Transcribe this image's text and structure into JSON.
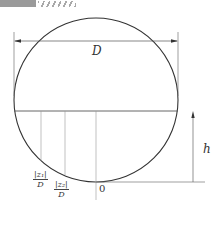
{
  "header": {
    "decoration": "striped-banner"
  },
  "diagram": {
    "title": "",
    "labels": {
      "diameter": "D",
      "height": "h",
      "origin": "0",
      "z1_num": "|z₁|",
      "z1_den": "D",
      "z2_num": "|z₂|",
      "z2_den": "D"
    },
    "colors": {
      "stroke": "#333333",
      "thin": "#888888"
    }
  }
}
